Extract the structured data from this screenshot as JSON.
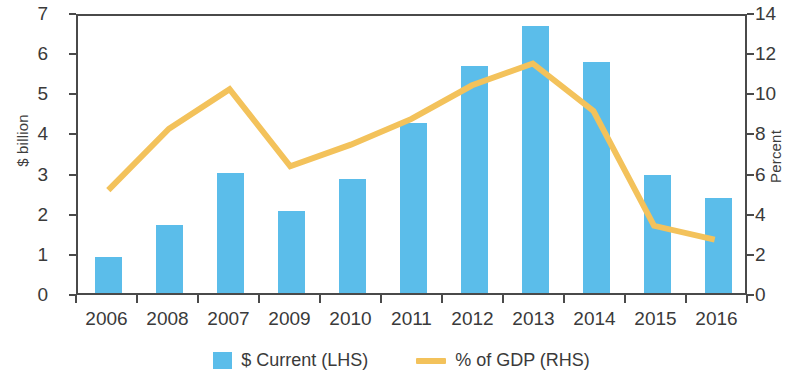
{
  "chart_data": {
    "type": "bar",
    "title": "",
    "subtitle": "",
    "xlabel": "",
    "categories": [
      "2006",
      "2008",
      "2007",
      "2009",
      "2010",
      "2011",
      "2012",
      "2013",
      "2014",
      "2015",
      "2016"
    ],
    "grid": false,
    "legend_position": "bottom",
    "axes": {
      "left": {
        "label": "$ billion",
        "ticks": [
          0,
          1,
          2,
          3,
          4,
          5,
          6,
          7
        ],
        "tick_labels": [
          "0",
          "1",
          "2",
          "3",
          "4",
          "5",
          "6",
          "7"
        ],
        "ylim": [
          0,
          7
        ]
      },
      "right": {
        "label": "Percent",
        "ticks": [
          0,
          2,
          4,
          6,
          8,
          10,
          12,
          14
        ],
        "tick_labels": [
          "0",
          "2",
          "4",
          "6",
          "8",
          "10",
          "12",
          "14"
        ],
        "ylim": [
          0,
          14
        ]
      }
    },
    "series": [
      {
        "name": "$ Current (LHS)",
        "type": "bar",
        "axis": "left",
        "color": "#5BBDEA",
        "values": [
          0.9,
          1.7,
          3.0,
          2.04,
          2.85,
          4.24,
          5.65,
          6.65,
          5.75,
          2.95,
          2.37
        ]
      },
      {
        "name": "% of GDP (RHS)",
        "type": "line",
        "axis": "right",
        "color": "#F5C council",
        "values": [
          5.2,
          8.3,
          10.3,
          6.4,
          7.5,
          8.8,
          10.5,
          11.6,
          9.2,
          3.4,
          2.7
        ]
      }
    ]
  },
  "legend": {
    "items": [
      {
        "label": "$ Current (LHS)",
        "marker": "square",
        "color": "#5BBDEA"
      },
      {
        "label": "% of GDP (RHS)",
        "marker": "line",
        "color": "#F3C25B"
      }
    ]
  },
  "colors": {
    "bar": "#5BBDEA",
    "line": "#F3C25B",
    "axis": "#4a4a4a",
    "text": "#3a3a3a",
    "background": "#ffffff"
  }
}
